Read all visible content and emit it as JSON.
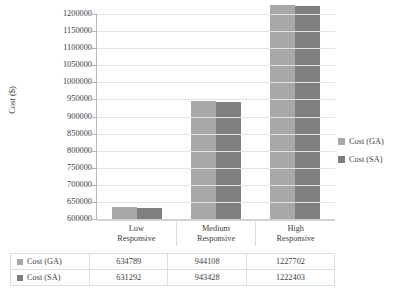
{
  "chart_data": {
    "type": "bar",
    "title": "",
    "xlabel": "",
    "ylabel": "Cost ($)",
    "categories": [
      "Low Responsive",
      "Medium Responsive",
      "High Responsive"
    ],
    "category_lines": [
      [
        "Low",
        "Responsive"
      ],
      [
        "Medium",
        "Responsive"
      ],
      [
        "High",
        "Responsive"
      ]
    ],
    "series": [
      {
        "name": "Cost (GA)",
        "color": "#a8a8a8",
        "values": [
          634789,
          944108,
          1227702
        ]
      },
      {
        "name": "Cost (SA)",
        "color": "#7f7f7f",
        "values": [
          631292,
          943428,
          1222403
        ]
      }
    ],
    "ylim": [
      600000,
      1200000
    ],
    "ytick_step": 50000,
    "yticks": [
      "600000",
      "650000",
      "700000",
      "750000",
      "800000",
      "850000",
      "900000",
      "950000",
      "1000000",
      "1050000",
      "1100000",
      "1150000",
      "1200000"
    ],
    "grid": true,
    "legend_position": "right"
  },
  "legend": {
    "items": [
      {
        "label": "Cost (GA)"
      },
      {
        "label": "Cost (SA)"
      }
    ]
  },
  "table": {
    "rows": [
      {
        "label": "Cost (GA)",
        "values": [
          "634789",
          "944108",
          "1227702"
        ]
      },
      {
        "label": "Cost (SA)",
        "values": [
          "631292",
          "943428",
          "1222403"
        ]
      }
    ]
  }
}
